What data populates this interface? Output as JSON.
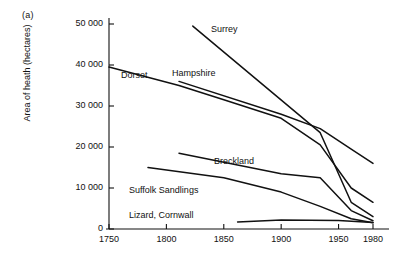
{
  "figure": {
    "panel_label": "(a)",
    "ylabel": "Area of heath (hectares)",
    "xlabel": ""
  },
  "chart_data": {
    "type": "line",
    "title": "",
    "xlabel": "",
    "ylabel": "Area of heath (hectares)",
    "xlim": [
      1740,
      1990
    ],
    "ylim": [
      0,
      52000
    ],
    "grid": false,
    "legend": "inline-labels",
    "xticks": [
      1750,
      1800,
      1850,
      1900,
      1950,
      1980
    ],
    "xtick_labels": [
      "1750",
      "1800",
      "1850",
      "1900",
      "1950",
      "1980"
    ],
    "yticks": [
      0,
      10000,
      20000,
      30000,
      40000,
      50000
    ],
    "ytick_labels": [
      "0",
      "10 000",
      "20 000",
      "30 000",
      "40 000",
      "50 000"
    ],
    "series": [
      {
        "name": "Surrey",
        "label": "Surrey",
        "x": [
          1823,
          1934,
          1961,
          1980
        ],
        "values": [
          49500,
          23500,
          6500,
          3000
        ]
      },
      {
        "name": "Hampshire",
        "label": "Hampshire",
        "x": [
          1811,
          1900,
          1934,
          1961,
          1980
        ],
        "values": [
          36000,
          28000,
          24500,
          19500,
          16000
        ]
      },
      {
        "name": "Dorset",
        "label": "Dorset",
        "x": [
          1750,
          1811,
          1850,
          1900,
          1934,
          1961,
          1980
        ],
        "values": [
          39500,
          35000,
          31500,
          27000,
          20500,
          10000,
          6500
        ]
      },
      {
        "name": "Breckland",
        "label": "Breckland",
        "x": [
          1811,
          1900,
          1934,
          1961,
          1980
        ],
        "values": [
          18500,
          13500,
          12500,
          4500,
          2000
        ]
      },
      {
        "name": "Suffolk Sandlings",
        "label": "Suffolk Sandlings",
        "x": [
          1784,
          1850,
          1900,
          1934,
          1961,
          1980
        ],
        "values": [
          15000,
          12500,
          9000,
          5500,
          2500,
          1500
        ]
      },
      {
        "name": "Lizard, Cornwall",
        "label": "Lizard, Cornwall",
        "x": [
          1862,
          1900,
          1950,
          1980
        ],
        "values": [
          1700,
          2200,
          2100,
          1600
        ]
      }
    ],
    "series_label_positions": [
      {
        "name": "Surrey",
        "x": 211,
        "y": 24
      },
      {
        "name": "Hampshire",
        "x": 172,
        "y": 68
      },
      {
        "name": "Dorset",
        "x": 121,
        "y": 70
      },
      {
        "name": "Breckland",
        "x": 214,
        "y": 156
      },
      {
        "name": "Suffolk Sandlings",
        "x": 129,
        "y": 185
      },
      {
        "name": "Lizard, Cornwall",
        "x": 129,
        "y": 210
      }
    ]
  }
}
